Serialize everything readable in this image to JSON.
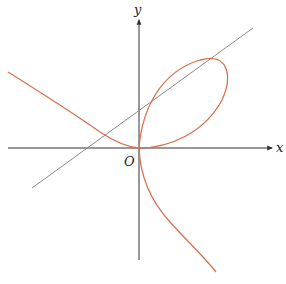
{
  "figure": {
    "axis_labels": {
      "x": "x",
      "y": "y",
      "origin": "O"
    },
    "colors": {
      "axis": "#333333",
      "curve": "#d9714e",
      "line": "#8a8a8a",
      "background": "#ffffff"
    },
    "elements": [
      {
        "name": "x-axis",
        "type": "arrow",
        "from": [
          8,
          148
        ],
        "to": [
          272,
          148
        ]
      },
      {
        "name": "y-axis",
        "type": "arrow",
        "from": [
          139,
          260
        ],
        "to": [
          139,
          20
        ]
      },
      {
        "name": "tangent-line",
        "type": "line",
        "from": [
          32,
          188
        ],
        "to": [
          253,
          28
        ]
      },
      {
        "name": "curve",
        "type": "folium-like cubic",
        "description": "loop in first quadrant passing through origin; branches extend to upper-left and lower-right"
      }
    ]
  }
}
